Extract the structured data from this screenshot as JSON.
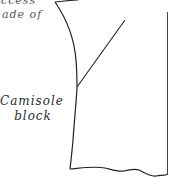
{
  "diagram": {
    "type": "sewing-pattern-block",
    "caption_fragments": [
      "ccess",
      "ade of"
    ],
    "label": {
      "line1": "Camisole",
      "line2": "block"
    },
    "colors": {
      "stroke": "#222222",
      "text": "#2b2b2b",
      "background": "#ffffff"
    }
  }
}
